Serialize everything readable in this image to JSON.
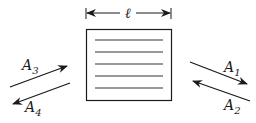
{
  "diagram": {
    "dimension_label": "ℓ",
    "slab_lines": 5,
    "arrows": [
      {
        "id": "A1",
        "base": "A",
        "sub": "1",
        "direction": "outgoing-right"
      },
      {
        "id": "A2",
        "base": "A",
        "sub": "2",
        "direction": "incoming-right"
      },
      {
        "id": "A3",
        "base": "A",
        "sub": "3",
        "direction": "incoming-left"
      },
      {
        "id": "A4",
        "base": "A",
        "sub": "4",
        "direction": "outgoing-left"
      }
    ],
    "colors": {
      "stroke": "#1a1a1a",
      "lines": "#333333",
      "background": "#ffffff"
    }
  }
}
